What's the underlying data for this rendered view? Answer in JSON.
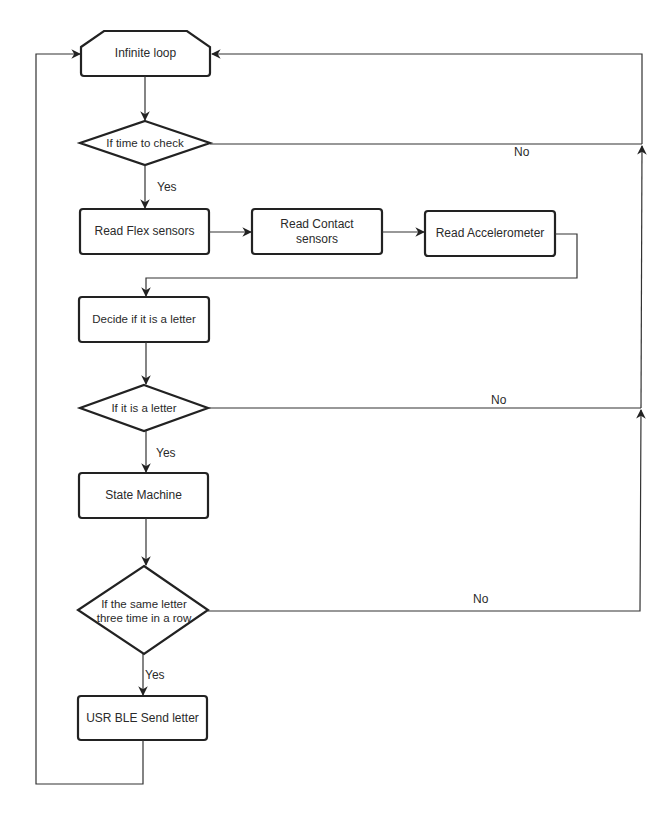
{
  "diagram": {
    "type": "flowchart",
    "colors": {
      "stroke": "#222222",
      "text": "#2a2a2a",
      "background": "#ffffff"
    },
    "nodes": [
      {
        "id": "loop",
        "shape": "hexagon-top-cut",
        "label": "Infinite loop"
      },
      {
        "id": "check_time",
        "shape": "diamond",
        "label": "If time to check"
      },
      {
        "id": "flex",
        "shape": "rect",
        "label": "Read Flex sensors"
      },
      {
        "id": "contact",
        "shape": "rect",
        "label": "Read Contact sensors"
      },
      {
        "id": "accel",
        "shape": "rect",
        "label": "Read Accelerometer"
      },
      {
        "id": "decide",
        "shape": "rect",
        "label": "Decide if it is a letter"
      },
      {
        "id": "is_letter",
        "shape": "diamond",
        "label": "If it is a letter"
      },
      {
        "id": "state",
        "shape": "rect",
        "label": "State Machine"
      },
      {
        "id": "same_three",
        "shape": "diamond",
        "label": "If the same letter three time in a row"
      },
      {
        "id": "send",
        "shape": "rect",
        "label": "USR BLE Send letter"
      }
    ],
    "edge_labels": {
      "check_time_yes": "Yes",
      "check_time_no": "No",
      "is_letter_yes": "Yes",
      "is_letter_no": "No",
      "same_three_yes": "Yes",
      "same_three_no": "No"
    },
    "edges": [
      {
        "from": "loop",
        "to": "check_time",
        "label": ""
      },
      {
        "from": "check_time",
        "to": "flex",
        "label": "Yes"
      },
      {
        "from": "check_time",
        "to": "loop",
        "label": "No"
      },
      {
        "from": "flex",
        "to": "contact",
        "label": ""
      },
      {
        "from": "contact",
        "to": "accel",
        "label": ""
      },
      {
        "from": "accel",
        "to": "decide",
        "label": ""
      },
      {
        "from": "decide",
        "to": "is_letter",
        "label": ""
      },
      {
        "from": "is_letter",
        "to": "state",
        "label": "Yes"
      },
      {
        "from": "is_letter",
        "to": "loop",
        "label": "No"
      },
      {
        "from": "state",
        "to": "same_three",
        "label": ""
      },
      {
        "from": "same_three",
        "to": "send",
        "label": "Yes"
      },
      {
        "from": "same_three",
        "to": "loop",
        "label": "No"
      },
      {
        "from": "send",
        "to": "loop",
        "label": ""
      }
    ]
  },
  "labels": {
    "loop": "Infinite loop",
    "check_time": "If time to check",
    "flex": "Read Flex sensors",
    "contact": "Read Contact sensors",
    "accel": "Read Accelerometer",
    "decide": "Decide if it is a letter",
    "is_letter": "If it is a letter",
    "state": "State Machine",
    "same_three": "If the same letter three time in a row",
    "send": "USR BLE Send letter",
    "yes": "Yes",
    "no": "No"
  }
}
